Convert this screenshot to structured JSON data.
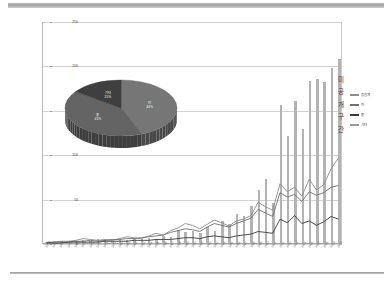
{
  "chart_data": {
    "type": "bar",
    "title": "",
    "subtitle": "",
    "xlabel": "",
    "ylabel": "",
    "ylim": [
      0,
      250
    ],
    "yticks": [
      0,
      50,
      100,
      150,
      200,
      250
    ],
    "grid": true,
    "legend_position": "right",
    "vertical_axis_label": "미공개구간",
    "categories": [
      "1970",
      "1971",
      "1972",
      "1973",
      "1974",
      "1975",
      "1976",
      "1977",
      "1978",
      "1979",
      "1980",
      "1981",
      "1982",
      "1983",
      "1984",
      "1985",
      "1986",
      "1987",
      "1988",
      "1989",
      "1990",
      "1991",
      "1992",
      "1993",
      "1994",
      "1995",
      "1996",
      "1997",
      "1998",
      "1999",
      "2000",
      "2001",
      "2002",
      "2003",
      "2004",
      "2005",
      "2006",
      "2007",
      "2008",
      "2009",
      "2010"
    ],
    "series": [
      {
        "name": "총합계",
        "type": "bar",
        "color": "#b3b3b3",
        "values": [
          1,
          1,
          2,
          1,
          2,
          3,
          2,
          4,
          3,
          2,
          4,
          3,
          5,
          4,
          6,
          5,
          8,
          7,
          15,
          12,
          13,
          11,
          18,
          14,
          25,
          21,
          33,
          30,
          42,
          60,
          72,
          45,
          155,
          120,
          160,
          128,
          182,
          185,
          181,
          197,
          207
        ]
      },
      {
        "name": "미",
        "type": "line",
        "color": "#8c8c8c",
        "values": [
          1,
          1,
          2,
          2,
          3,
          5,
          4,
          3,
          4,
          3,
          5,
          7,
          6,
          5,
          8,
          11,
          9,
          14,
          17,
          22,
          20,
          16,
          21,
          26,
          23,
          19,
          25,
          27,
          31,
          46,
          41,
          37,
          67,
          58,
          63,
          53,
          72,
          60,
          66,
          84,
          96
        ]
      },
      {
        "name": "중",
        "type": "line",
        "color": "#6f6f6f",
        "values": [
          0,
          1,
          1,
          1,
          2,
          2,
          3,
          2,
          3,
          4,
          4,
          5,
          5,
          6,
          7,
          8,
          9,
          12,
          14,
          16,
          15,
          13,
          18,
          22,
          20,
          18,
          22,
          25,
          28,
          38,
          34,
          30,
          57,
          52,
          55,
          47,
          58,
          54,
          57,
          63,
          65
        ]
      },
      {
        "name": "기타",
        "type": "line",
        "color": "#3a3a3a",
        "values": [
          0,
          0,
          0,
          1,
          1,
          1,
          1,
          1,
          2,
          2,
          2,
          2,
          3,
          3,
          3,
          4,
          4,
          4,
          5,
          6,
          6,
          5,
          7,
          8,
          7,
          6,
          8,
          9,
          10,
          13,
          12,
          11,
          27,
          23,
          31,
          22,
          25,
          20,
          24,
          30,
          27
        ]
      }
    ],
    "legend": [
      {
        "label": "총합계",
        "color": "#8c8c8c"
      },
      {
        "label": "미",
        "color": "#6f6f6f"
      },
      {
        "label": "중",
        "color": "#3a3a3a"
      },
      {
        "label": "기타",
        "color": "#9a9a9a"
      }
    ]
  },
  "pie_chart": {
    "type": "pie",
    "style": "3d",
    "slices": [
      {
        "label": "미",
        "percent": "44%",
        "value": 44,
        "color": "#767676"
      },
      {
        "label": "중",
        "percent": "41%",
        "value": 41,
        "color": "#646464"
      },
      {
        "label": "기타",
        "percent": "15%",
        "value": 15,
        "color": "#3f3f3f"
      }
    ]
  }
}
